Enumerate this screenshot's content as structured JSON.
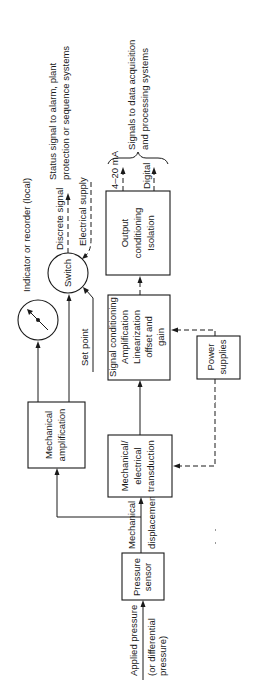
{
  "diagram": {
    "inputs": {
      "applied_pressure": "Applied pressure",
      "differential_line1": "(or differential",
      "differential_line2": "pressure)"
    },
    "nodes": {
      "pressure_sensor": {
        "line1": "Pressure",
        "line2": "sensor"
      },
      "mech_elec_transduction": {
        "line1": "Mechanical/",
        "line2": "electrical",
        "line3": "transduction"
      },
      "mech_amplification": {
        "line1": "Mechanical",
        "line2": "amplification"
      },
      "signal_conditioning": {
        "line1": "Signal conditioning",
        "line2": "Amplification",
        "line3": "Linearization",
        "line4": "offset and",
        "line5": "gain"
      },
      "power_supplies": {
        "line1": "Power",
        "line2": "supplies"
      },
      "output_conditioning": {
        "line1": "Output",
        "line2": "conditioning",
        "line3": "Isolation"
      },
      "switch": {
        "label": "Switch"
      },
      "indicator": {
        "label": "Indicator or recorder (local)"
      }
    },
    "edge_labels": {
      "mechanical": "Mechanical",
      "displacement": "displacement",
      "set_point": "Set point",
      "discrete_signal": "Discrete signal",
      "electrical_supply": "Electrical supply",
      "ma_output": "4–20 mA",
      "digital_output": "Digital"
    },
    "outputs": {
      "status_line1": "Status signal to alarm, plant",
      "status_line2": "protection or sequence systems",
      "signals_line1": "Signals to data acquisition",
      "signals_line2": "and processing systems"
    }
  }
}
